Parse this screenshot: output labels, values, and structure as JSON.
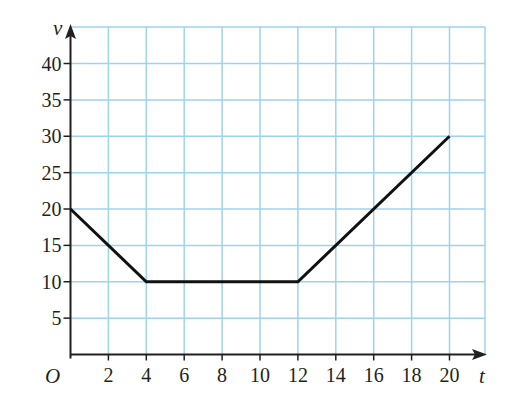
{
  "chart_data": {
    "type": "line",
    "title": "",
    "xlabel": "t",
    "ylabel": "v",
    "origin_label": "O",
    "x": [
      0,
      4,
      12,
      20
    ],
    "y": [
      20,
      10,
      10,
      30
    ],
    "series": [
      {
        "name": "v-t graph",
        "x": [
          0,
          4,
          12,
          20
        ],
        "values": [
          20,
          10,
          10,
          30
        ]
      }
    ],
    "xticks": [
      2,
      4,
      6,
      8,
      10,
      12,
      14,
      16,
      18,
      20
    ],
    "yticks": [
      5,
      10,
      15,
      20,
      25,
      30,
      35,
      40
    ],
    "xlim": [
      0,
      22
    ],
    "ylim": [
      0,
      45
    ],
    "grid": true,
    "legend": null
  },
  "style": {
    "grid_color": "#9dd3ee",
    "axis_color": "#231f20",
    "line_color": "#111111"
  },
  "labels": {
    "x_axis": "t",
    "y_axis": "v",
    "origin": "O"
  }
}
